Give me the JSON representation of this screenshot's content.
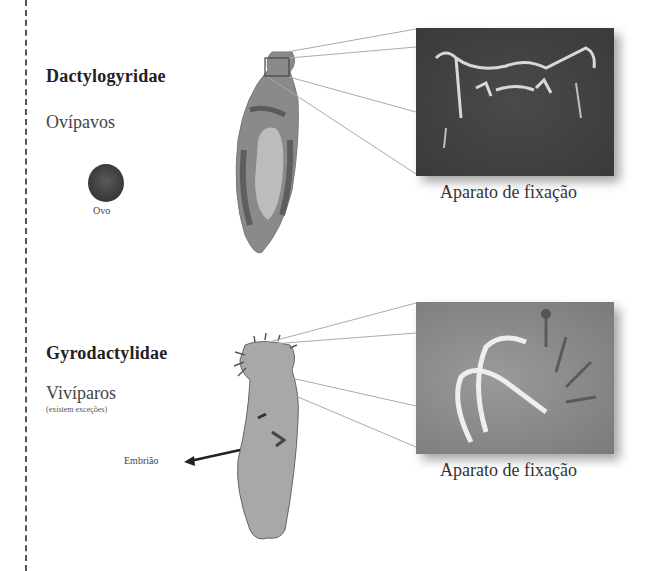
{
  "panels": [
    {
      "family": "Dactylogyridae",
      "reproduction": "Ovípavos",
      "egg_label": "Ovo",
      "caption": "Aparato de fixação"
    },
    {
      "family": "Gyrodactylidae",
      "reproduction": "Vivíparos",
      "note": "(existem exceções)",
      "embryo_label": "Embrião",
      "caption": "Aparato de fixação"
    }
  ],
  "colors": {
    "text_dark": "#222222",
    "specimen_gray": "#8a8a8a",
    "micrograph_dark": "#3a3a3a",
    "micrograph_light": "#8a8a8a",
    "leader_line": "#aaaaaa"
  }
}
